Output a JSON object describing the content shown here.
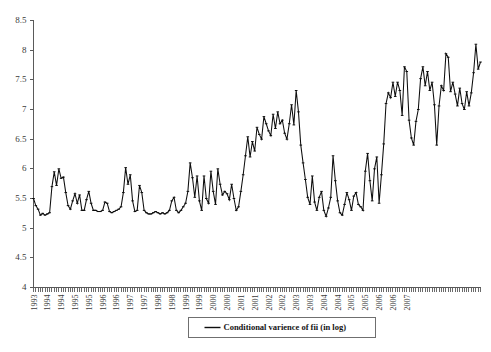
{
  "chart_data": {
    "type": "line",
    "title": "",
    "subtitle": "",
    "xlabel": "",
    "ylabel": "",
    "ylim": [
      4,
      8.5
    ],
    "yticks": [
      4,
      4.5,
      5,
      5.5,
      6,
      6.5,
      7,
      7.5,
      8,
      8.5
    ],
    "ytick_labels": [
      "4",
      "4.5",
      "5",
      "5.5",
      "6",
      "6.5",
      "7",
      "7.5",
      "8",
      "8.5"
    ],
    "grid": false,
    "legend_position": "bottom-center",
    "legend": [
      "Conditional varience of fii (in log)"
    ],
    "xtick_labels": [
      "1993",
      "1994",
      "1994",
      "1995",
      "1995",
      "1996",
      "1996",
      "1997",
      "1997",
      "1998",
      "1998",
      "1999",
      "1999",
      "2000",
      "2000",
      "2001",
      "2001",
      "2002",
      "2002",
      "2003",
      "2003",
      "2004",
      "2004",
      "2005",
      "2005",
      "2006",
      "2006",
      "2007"
    ],
    "x_tick_interval_months": 1,
    "x_label_interval_months": 6,
    "x_start": "1993-01",
    "x_end": "2007-06",
    "series": [
      {
        "name": "Conditional varience of fii (in log)",
        "color": "#0d0d0d",
        "values": [
          5.5,
          5.38,
          5.32,
          5.22,
          5.25,
          5.22,
          5.24,
          5.26,
          5.7,
          5.95,
          5.72,
          6.0,
          5.84,
          5.86,
          5.6,
          5.38,
          5.32,
          5.46,
          5.58,
          5.42,
          5.56,
          5.3,
          5.3,
          5.48,
          5.62,
          5.42,
          5.3,
          5.3,
          5.28,
          5.28,
          5.3,
          5.44,
          5.42,
          5.28,
          5.26,
          5.28,
          5.3,
          5.32,
          5.36,
          5.6,
          6.02,
          5.74,
          5.9,
          5.46,
          5.28,
          5.3,
          5.72,
          5.6,
          5.3,
          5.26,
          5.24,
          5.24,
          5.26,
          5.28,
          5.26,
          5.24,
          5.26,
          5.24,
          5.26,
          5.3,
          5.46,
          5.52,
          5.3,
          5.26,
          5.3,
          5.36,
          5.42,
          5.62,
          6.1,
          5.85,
          5.52,
          5.88,
          5.46,
          5.3,
          5.88,
          5.5,
          5.42,
          5.96,
          5.62,
          5.4,
          6.0,
          5.74,
          5.56,
          5.62,
          5.58,
          5.48,
          5.74,
          5.5,
          5.3,
          5.36,
          5.62,
          5.9,
          6.22,
          6.54,
          6.2,
          6.46,
          6.3,
          6.7,
          6.58,
          6.5,
          6.88,
          6.76,
          6.64,
          6.56,
          6.92,
          6.68,
          6.96,
          6.76,
          6.82,
          6.6,
          6.5,
          6.76,
          7.08,
          6.74,
          7.32,
          6.96,
          6.4,
          6.1,
          5.82,
          5.52,
          5.4,
          5.88,
          5.44,
          5.3,
          5.52,
          5.62,
          5.3,
          5.2,
          5.34,
          5.52,
          6.22,
          5.8,
          5.46,
          5.26,
          5.22,
          5.4,
          5.6,
          5.48,
          5.3,
          5.54,
          5.6,
          5.4,
          5.36,
          5.3,
          5.96,
          6.26,
          5.8,
          5.46,
          6.0,
          6.2,
          5.42,
          5.9,
          6.42,
          7.1,
          7.28,
          7.2,
          7.46,
          7.22,
          7.46,
          7.32,
          6.9,
          7.72,
          7.64,
          6.82,
          6.52,
          6.4,
          6.8,
          7.0,
          7.52,
          7.72,
          7.4,
          7.64,
          7.32,
          7.46,
          7.08,
          6.4,
          7.06,
          7.4,
          7.32,
          7.94,
          7.88,
          7.3,
          7.46,
          7.26,
          7.06,
          7.36,
          7.1,
          7.0,
          7.3,
          7.06,
          7.28,
          7.62,
          8.1,
          7.68,
          7.8
        ]
      }
    ]
  },
  "legend": {
    "entry_label": "Conditional varience of fii (in log)"
  },
  "axes": {
    "y_labels": [
      "8.5",
      "8",
      "7.5",
      "7",
      "6.5",
      "6",
      "5.5",
      "5",
      "4.5",
      "4"
    ]
  }
}
